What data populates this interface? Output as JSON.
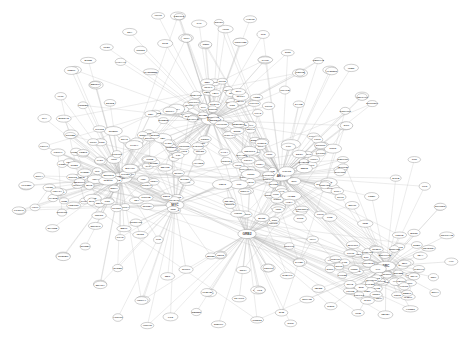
{
  "figure": {
    "title": "",
    "background_color": "#ffffff",
    "width": 467,
    "height": 341,
    "node_fill": "#ffffff",
    "node_stroke": "#8d8d8d",
    "edge_color": "#b9b9b9",
    "label_color": "#4a4a4a"
  },
  "chart_data": {
    "type": "scatter",
    "title": "",
    "xlabel": "",
    "ylabel": "",
    "grid": false,
    "legend": "none",
    "xlim": [
      0,
      467
    ],
    "ylim": [
      0,
      341
    ],
    "layout": "force-directed",
    "node_count": 286,
    "edge_count": 812,
    "clusters": [
      {
        "name": "left-hub",
        "center": [
          120,
          178
        ],
        "radius": 62,
        "members": 78
      },
      {
        "name": "upper-center-hub",
        "center": [
          211,
          120
        ],
        "radius": 52,
        "members": 64
      },
      {
        "name": "center-right-hub",
        "center": [
          280,
          176
        ],
        "radius": 55,
        "members": 70
      },
      {
        "name": "lower-right-star",
        "center": [
          386,
          266
        ],
        "radius": 44,
        "members": 52
      },
      {
        "name": "periphery",
        "center": [
          233,
          170
        ],
        "radius": 230,
        "members": 22
      }
    ],
    "hubs": [
      {
        "label": "HUB1",
        "x": 120,
        "y": 178,
        "degree": 61
      },
      {
        "label": "HUB2",
        "x": 211,
        "y": 120,
        "degree": 54
      },
      {
        "label": "HUB3",
        "x": 281,
        "y": 176,
        "degree": 57
      },
      {
        "label": "HUB4",
        "x": 386,
        "y": 266,
        "degree": 49
      },
      {
        "label": "HUB5",
        "x": 175,
        "y": 205,
        "degree": 33
      }
    ],
    "nodes": [
      {
        "id": "n000",
        "label": "TP53",
        "x": 121,
        "y": 178,
        "rx": 11.0,
        "ry": 5.2
      },
      {
        "id": "n001",
        "label": "EGFR",
        "x": 212,
        "y": 120,
        "rx": 10.6,
        "ry": 5.0
      },
      {
        "id": "n002",
        "label": "AKT1",
        "x": 281,
        "y": 176,
        "rx": 10.2,
        "ry": 4.9
      },
      {
        "id": "n003",
        "label": "SRC",
        "x": 386,
        "y": 266,
        "rx": 9.6,
        "ry": 4.7
      },
      {
        "id": "n004",
        "label": "MYC",
        "x": 175,
        "y": 205,
        "rx": 9.0,
        "ry": 4.5
      },
      {
        "id": "n005",
        "label": "GRB2",
        "x": 247,
        "y": 234,
        "rx": 9.2,
        "ry": 4.6
      },
      {
        "id": "n006",
        "label": "JUN",
        "x": 71,
        "y": 134,
        "rx": 7.4,
        "ry": 4.1
      },
      {
        "id": "n007",
        "label": "FOS",
        "x": 96,
        "y": 85,
        "rx": 7.2,
        "ry": 4.0
      },
      {
        "id": "n008",
        "label": "STAT3",
        "x": 178,
        "y": 16,
        "rx": 7.6,
        "ry": 4.0
      },
      {
        "id": "n009",
        "label": "MAPK1",
        "x": 186,
        "y": 38,
        "rx": 7.4,
        "ry": 4.0
      },
      {
        "id": "n010",
        "label": "CDK2",
        "x": 205,
        "y": 45,
        "rx": 6.6,
        "ry": 3.8
      },
      {
        "id": "n011",
        "label": "RB1",
        "x": 240,
        "y": 42,
        "rx": 6.6,
        "ry": 3.8
      },
      {
        "id": "n012",
        "label": "ESR1",
        "x": 265,
        "y": 60,
        "rx": 6.8,
        "ry": 3.9
      },
      {
        "id": "n013",
        "label": "CTNNB1",
        "x": 300,
        "y": 73,
        "rx": 7.6,
        "ry": 4.0
      },
      {
        "id": "n014",
        "label": "SMAD3",
        "x": 330,
        "y": 70,
        "rx": 7.2,
        "ry": 3.9
      },
      {
        "id": "n015",
        "label": "PTEN",
        "x": 362,
        "y": 96,
        "rx": 6.8,
        "ry": 3.9
      },
      {
        "id": "n016",
        "label": "CCND1",
        "x": 345,
        "y": 126,
        "rx": 7.2,
        "ry": 3.9
      },
      {
        "id": "n017",
        "label": "NFKB1",
        "x": 322,
        "y": 146,
        "rx": 7.2,
        "ry": 3.9
      },
      {
        "id": "n018",
        "label": "HDAC1",
        "x": 310,
        "y": 165,
        "rx": 7.2,
        "ry": 3.9
      },
      {
        "id": "n019",
        "label": "SP1",
        "x": 440,
        "y": 207,
        "rx": 4.6,
        "ry": 3.2
      },
      {
        "id": "n020",
        "label": "BRCA1",
        "x": 26,
        "y": 186,
        "rx": 6.8,
        "ry": 3.9
      },
      {
        "id": "n021",
        "label": "ATM",
        "x": 20,
        "y": 211,
        "rx": 6.0,
        "ry": 3.6
      },
      {
        "id": "n022",
        "label": "CHEK2",
        "x": 63,
        "y": 256,
        "rx": 7.2,
        "ry": 3.9
      },
      {
        "id": "n023",
        "label": "PLK1",
        "x": 100,
        "y": 284,
        "rx": 6.6,
        "ry": 3.8
      },
      {
        "id": "n024",
        "label": "AURKA",
        "x": 143,
        "y": 300,
        "rx": 7.0,
        "ry": 3.9
      },
      {
        "id": "n025",
        "label": "BUB1",
        "x": 210,
        "y": 293,
        "rx": 6.6,
        "ry": 3.8
      },
      {
        "id": "n026",
        "label": "MAD2L1",
        "x": 258,
        "y": 290,
        "rx": 7.4,
        "ry": 4.0
      },
      {
        "id": "n027",
        "label": "CDC20",
        "x": 268,
        "y": 268,
        "rx": 7.2,
        "ry": 3.9
      },
      {
        "id": "n028",
        "label": "ESPL1",
        "x": 300,
        "y": 262,
        "rx": 6.8,
        "ry": 3.9
      },
      {
        "id": "n029",
        "label": "PTTG1",
        "x": 220,
        "y": 255,
        "rx": 6.8,
        "ry": 3.9
      },
      {
        "id": "n030",
        "label": "XPO1",
        "x": 75,
        "y": 70,
        "rx": 6.4,
        "ry": 3.7
      }
    ]
  },
  "accessibility": {
    "graph_role": "network-diagram",
    "summary": "Large force-directed network graph on white background"
  }
}
